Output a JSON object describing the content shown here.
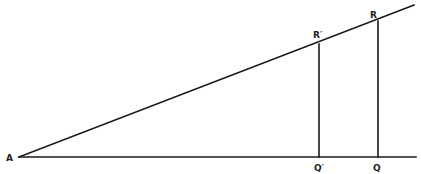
{
  "diagram": {
    "type": "geometry-similar-triangles",
    "colors": {
      "line": "#1a1a1a",
      "label": "#222222",
      "background": "#ffffff"
    },
    "points": {
      "A": {
        "label": "A",
        "x": 19,
        "y": 157
      },
      "R_prime": {
        "label": "R′",
        "x": 319,
        "y": 44
      },
      "R": {
        "label": "R",
        "x": 378,
        "y": 21
      },
      "Q_prime": {
        "label": "Q′",
        "x": 319,
        "y": 157
      },
      "Q": {
        "label": "Q",
        "x": 378,
        "y": 157
      }
    },
    "segments": [
      {
        "name": "baseline",
        "from": [
          19,
          157
        ],
        "to": [
          416,
          157
        ]
      },
      {
        "name": "hypotenuse",
        "from": [
          19,
          157
        ],
        "to": [
          414,
          5
        ]
      },
      {
        "name": "R-prime-Q-prime",
        "from": [
          319,
          44
        ],
        "to": [
          319,
          157
        ]
      },
      {
        "name": "R-Q",
        "from": [
          378,
          21
        ],
        "to": [
          378,
          157
        ]
      }
    ]
  }
}
